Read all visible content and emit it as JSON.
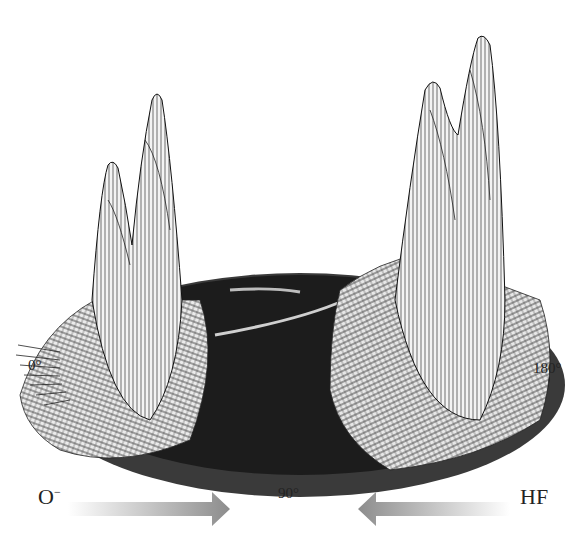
{
  "figure": {
    "type": "3D polar surface (angular distribution) plot",
    "angle_labels": {
      "left": "0°",
      "bottom": "90°",
      "right": "180°"
    },
    "reactants": {
      "left": {
        "label": "O",
        "charge": "−",
        "arrow_direction": "right"
      },
      "right": {
        "label": "HF",
        "arrow_direction": "left"
      }
    },
    "colors": {
      "surface_line": "#1a1a1a",
      "surface_fill": "#f2f2f2",
      "disc_dark": "#1c1c1c",
      "arrow_gray": "#8c8c8c",
      "text": "#222222"
    },
    "features": {
      "left_peaks": 2,
      "right_peaks": 2,
      "center": "dark flat disc (low intensity)"
    }
  }
}
